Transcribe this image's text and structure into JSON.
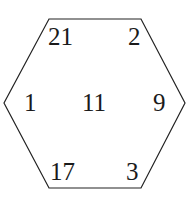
{
  "diagram": {
    "shape": "hexagon",
    "stroke_color": "#222222",
    "vertices": [
      [
        49,
        19
      ],
      [
        141,
        19
      ],
      [
        185,
        103
      ],
      [
        141,
        188
      ],
      [
        49,
        188
      ],
      [
        4,
        103
      ]
    ],
    "labels": [
      {
        "id": "top-left",
        "value": "21",
        "x": 48,
        "y": 45
      },
      {
        "id": "top-right",
        "value": "2",
        "x": 128,
        "y": 45
      },
      {
        "id": "left",
        "value": "1",
        "x": 24,
        "y": 111
      },
      {
        "id": "center",
        "value": "11",
        "x": 82,
        "y": 111
      },
      {
        "id": "right",
        "value": "9",
        "x": 153,
        "y": 111
      },
      {
        "id": "bottom-left",
        "value": "17",
        "x": 50,
        "y": 180
      },
      {
        "id": "bottom-right",
        "value": "3",
        "x": 126,
        "y": 180
      }
    ]
  }
}
